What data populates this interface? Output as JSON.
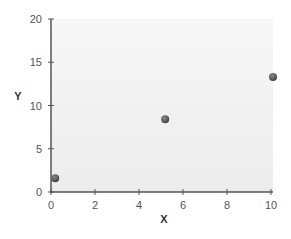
{
  "chart_data": {
    "type": "scatter",
    "title": "",
    "xlabel": "X",
    "ylabel": "Y",
    "xlim": [
      0,
      10
    ],
    "ylim": [
      0,
      20
    ],
    "xticks": [
      0,
      2,
      4,
      6,
      8,
      10
    ],
    "yticks": [
      0,
      5,
      10,
      15,
      20
    ],
    "grid": false,
    "legend": null,
    "series": [
      {
        "name": "points",
        "color": "#555555",
        "points": [
          {
            "x": 0.1,
            "y": 1.6
          },
          {
            "x": 5.1,
            "y": 8.4
          },
          {
            "x": 10.0,
            "y": 13.3
          }
        ]
      }
    ]
  },
  "colors": {
    "plot_background": "#f1f1f1",
    "axis": "#555555",
    "marker": "#555555"
  }
}
